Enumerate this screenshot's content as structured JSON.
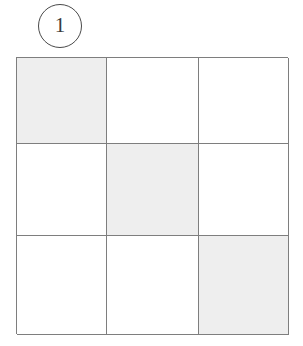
{
  "figure": {
    "panel_label": "1",
    "label_shape": "circle"
  },
  "grid": {
    "rows": 3,
    "columns": 3,
    "cell_white_color": "#ffffff",
    "cell_shaded_color": "#eeeeee",
    "line_color": "#7e7e7e",
    "cells": [
      {
        "id": "r1c1",
        "row": 1,
        "col": 1,
        "state": "shaded"
      },
      {
        "id": "r1c2",
        "row": 1,
        "col": 2,
        "state": "empty"
      },
      {
        "id": "r1c3",
        "row": 1,
        "col": 3,
        "state": "empty"
      },
      {
        "id": "r2c1",
        "row": 2,
        "col": 1,
        "state": "empty"
      },
      {
        "id": "r2c2",
        "row": 2,
        "col": 2,
        "state": "shaded"
      },
      {
        "id": "r2c3",
        "row": 2,
        "col": 3,
        "state": "empty"
      },
      {
        "id": "r3c1",
        "row": 3,
        "col": 1,
        "state": "empty"
      },
      {
        "id": "r3c2",
        "row": 3,
        "col": 2,
        "state": "empty"
      },
      {
        "id": "r3c3",
        "row": 3,
        "col": 3,
        "state": "shaded"
      }
    ]
  }
}
